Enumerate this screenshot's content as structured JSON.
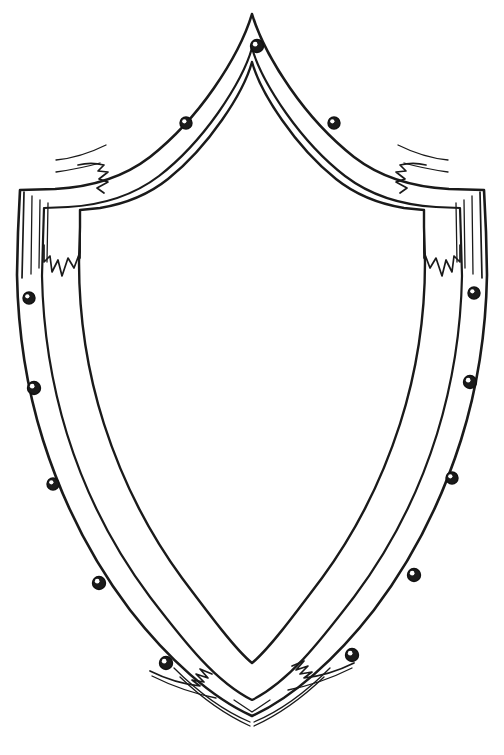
{
  "artwork": {
    "title": "Heraldic Shield Outline",
    "subject": "blank medieval kite shield line drawing",
    "medium": "ink line art",
    "style": "black outline on white, uncolored coloring-page",
    "canvas": {
      "width": 504,
      "height": 755,
      "background": "#ffffff"
    },
    "ink_color": "#1a1a1a",
    "fill_color": "#ffffff"
  },
  "shield": {
    "name": "shield",
    "description": "Pointed-top heraldic shield with a riveted outer band, squared shoulders and a V-shaped base point",
    "apex": {
      "x": 252,
      "y": 14
    },
    "base_point": {
      "x": 252,
      "y": 716
    },
    "widest": {
      "left_x": 16,
      "right_x": 488,
      "y": 196
    },
    "shoulder_left": {
      "x": 20,
      "y": 190
    },
    "shoulder_right": {
      "x": 484,
      "y": 190
    },
    "band_width_px": 26,
    "outline_path": "M252,14 C240,46 206,104 168,142 C126,183 74,190 20,190 L18,280 C22,400 66,520 140,618 C186,678 224,704 252,716 C280,704 318,678 364,618 C438,520 482,400 486,280 L484,190 C430,190 378,183 336,142 C298,104 264,46 252,14 Z",
    "inner_path": "M252,60 C242,88 212,136 180,168 C144,202 96,212 46,212 L44,286 C48,396 88,508 156,600 C196,652 228,678 252,690 C276,678 308,652 348,600 C416,508 456,396 460,286 L458,212 C408,212 360,202 324,168 C292,136 262,88 252,60 Z"
  },
  "rivets": {
    "name": "rivets",
    "description": "Round metal studs spaced evenly along the shield's outer band",
    "count": 13,
    "radius_px": 6,
    "fill": "#1b1b1b",
    "highlight": "#ffffff",
    "positions": [
      {
        "id": "rivet-apex",
        "x": 257,
        "y": 46,
        "r": 6.5
      },
      {
        "id": "rivet-upper-left",
        "x": 186,
        "y": 123,
        "r": 6.0
      },
      {
        "id": "rivet-upper-right",
        "x": 334,
        "y": 123,
        "r": 6.0
      },
      {
        "id": "rivet-left-1",
        "x": 29,
        "y": 298,
        "r": 6.0
      },
      {
        "id": "rivet-right-1",
        "x": 474,
        "y": 293,
        "r": 6.0
      },
      {
        "id": "rivet-left-2",
        "x": 34,
        "y": 388,
        "r": 6.5
      },
      {
        "id": "rivet-right-2",
        "x": 470,
        "y": 382,
        "r": 6.5
      },
      {
        "id": "rivet-left-3",
        "x": 53,
        "y": 484,
        "r": 6.0
      },
      {
        "id": "rivet-right-3",
        "x": 452,
        "y": 478,
        "r": 6.0
      },
      {
        "id": "rivet-left-4",
        "x": 99,
        "y": 583,
        "r": 6.5
      },
      {
        "id": "rivet-right-4",
        "x": 414,
        "y": 575,
        "r": 6.5
      },
      {
        "id": "rivet-left-5",
        "x": 166,
        "y": 663,
        "r": 6.5
      },
      {
        "id": "rivet-right-5",
        "x": 352,
        "y": 655,
        "r": 6.5
      }
    ]
  },
  "ornaments": {
    "name": "ornaments",
    "description": "Hand-drawn zigzag flourishes where the band segments overlap",
    "items": [
      {
        "id": "flourish-shoulder-left",
        "x": 98,
        "y": 180,
        "label": "left shoulder zigzag"
      },
      {
        "id": "flourish-shoulder-right",
        "x": 414,
        "y": 180,
        "label": "right shoulder zigzag"
      },
      {
        "id": "flourish-inner-left",
        "x": 38,
        "y": 265,
        "label": "left inner drip zigzag"
      },
      {
        "id": "flourish-inner-right",
        "x": 468,
        "y": 258,
        "label": "right inner drip zigzag"
      },
      {
        "id": "flourish-base-left",
        "x": 196,
        "y": 680,
        "label": "left base zigzag"
      },
      {
        "id": "flourish-base-right",
        "x": 312,
        "y": 672,
        "label": "right base zigzag"
      }
    ]
  }
}
